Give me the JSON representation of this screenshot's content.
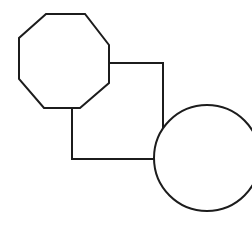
{
  "diagram": {
    "background": "#ffffff",
    "stroke_color": "#1c1c1c",
    "stroke_width": 2,
    "shapes": [
      {
        "id": "octagon",
        "type": "polygon",
        "points": "46,14 85,14 109,45 109,83 80,108 44,108 19,79 19,38"
      },
      {
        "id": "square",
        "type": "polyline",
        "points": "109,63 163,63 163,131"
      },
      {
        "id": "square-bottom",
        "type": "polyline",
        "points": "72,108 72,159 156,159"
      },
      {
        "id": "circle",
        "type": "circle",
        "cx": 207,
        "cy": 158,
        "r": 53
      }
    ]
  }
}
